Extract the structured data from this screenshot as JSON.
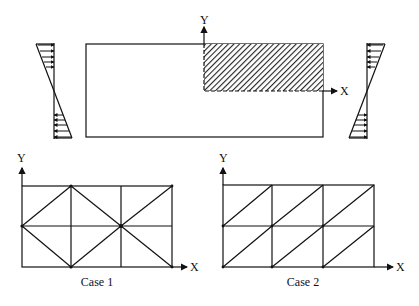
{
  "figure": {
    "top": {
      "axis_x_label": "X",
      "axis_y_label": "Y",
      "description": "Rectangular plate under linearly varying edge loads; shaded upper-right quarter region modeled"
    },
    "case1": {
      "caption": "Case 1",
      "axis_x_label": "X",
      "axis_y_label": "Y",
      "mesh": "3x2 grid with crossed diagonal pattern"
    },
    "case2": {
      "caption": "Case 2",
      "axis_x_label": "X",
      "axis_y_label": "Y",
      "mesh": "3x2 grid with uniform diagonals"
    }
  },
  "colors": {
    "line": "#111111",
    "background": "#ffffff"
  }
}
